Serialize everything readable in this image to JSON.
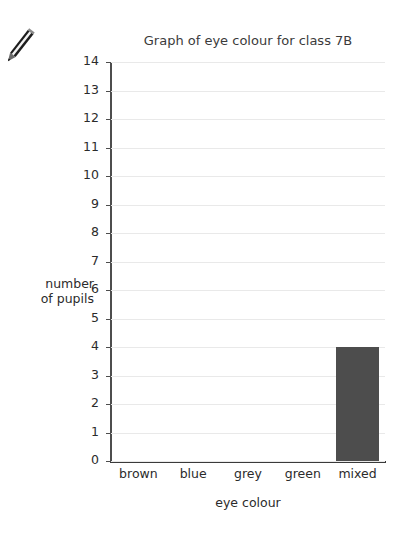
{
  "decoration": {
    "pencil_icon_name": "pencil-icon"
  },
  "chart_data": {
    "type": "bar",
    "title": "Graph of eye colour for class 7B",
    "xlabel": "eye colour",
    "ylabel_line1": "number",
    "ylabel_line2": "of pupils",
    "ylabel": "number of pupils",
    "categories": [
      "brown",
      "blue",
      "grey",
      "green",
      "mixed"
    ],
    "values": [
      0,
      0,
      0,
      0,
      4
    ],
    "ylim": [
      0,
      14
    ],
    "ytick_step": 1,
    "yticks": [
      0,
      1,
      2,
      3,
      4,
      5,
      6,
      7,
      8,
      9,
      10,
      11,
      12,
      13,
      14
    ],
    "ytick_labels": [
      "0",
      "1",
      "2",
      "3",
      "4",
      "5",
      "6",
      "7",
      "8",
      "9",
      "10",
      "11",
      "12",
      "13",
      "14"
    ],
    "grid": true,
    "legend": null,
    "bar_color": "#4d4d4d",
    "gridline_color": "#e9e9e9",
    "axis_color": "#4d4d4d",
    "background_color": "#ffffff"
  }
}
